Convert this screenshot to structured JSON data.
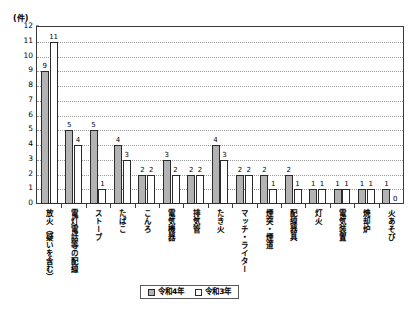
{
  "chart_data": {
    "type": "bar",
    "title": "",
    "xlabel": "",
    "ylabel": "(件)",
    "unit_label": "(件)",
    "ylim": [
      0,
      12
    ],
    "yticks": [
      0,
      1,
      2,
      3,
      4,
      5,
      6,
      7,
      8,
      9,
      10,
      11,
      12
    ],
    "grid": true,
    "legend_position": "bottom-center",
    "categories": [
      "放火（疑いを含む）",
      "電灯電話等の配線",
      "ストーブ",
      "たばこ",
      "こんろ",
      "電気機器",
      "排気管",
      "たき火",
      "マッチ・ライター",
      "煙突・煙道",
      "配線器具",
      "灯火",
      "電気装置",
      "焼却炉",
      "火あそび"
    ],
    "series": [
      {
        "name": "令和4年",
        "color": "#b3b3b3",
        "values": [
          9,
          5,
          5,
          4,
          2,
          3,
          2,
          4,
          2,
          2,
          2,
          1,
          1,
          1,
          1
        ]
      },
      {
        "name": "令和3年",
        "color": "#ffffff",
        "values": [
          11,
          4,
          1,
          3,
          2,
          2,
          2,
          3,
          2,
          1,
          1,
          1,
          1,
          1,
          0
        ]
      }
    ]
  },
  "legend": {
    "items": [
      {
        "label": "令和4年",
        "swatch": "s0"
      },
      {
        "label": "令和3年",
        "swatch": "s1"
      }
    ]
  }
}
